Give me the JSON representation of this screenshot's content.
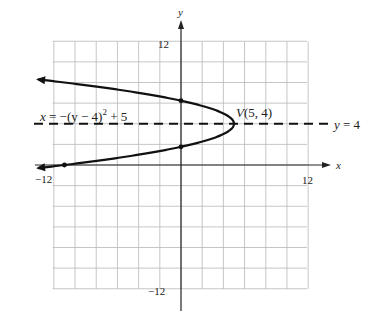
{
  "chart_data": {
    "type": "line",
    "title": "",
    "xlabel": "x",
    "ylabel": "y",
    "xlim": [
      -12,
      12
    ],
    "ylim": [
      -12,
      12
    ],
    "grid": true,
    "grid_step": 2,
    "x_tick_labels": [
      "-12",
      "12"
    ],
    "y_tick_labels": [
      "12",
      "-12"
    ],
    "series": [
      {
        "name": "x = -(y - 4)^2 + 5",
        "kind": "parabola",
        "equation": "x = -(y - 4)^2 + 5",
        "y_range": [
          -0.3,
          8.3
        ],
        "style": "solid",
        "arrows": "both-ends"
      },
      {
        "name": "y = 4",
        "kind": "axis-of-symmetry",
        "equation": "y = 4",
        "style": "dashed"
      }
    ],
    "points": [
      {
        "label": "V(5, 4)",
        "x": 5,
        "y": 4,
        "role": "vertex"
      },
      {
        "label": "",
        "x": 0,
        "y": 6.24,
        "role": "y-intercept"
      },
      {
        "label": "",
        "x": 0,
        "y": 1.76,
        "role": "y-intercept"
      },
      {
        "label": "",
        "x": -11,
        "y": 0,
        "role": "x-intercept"
      }
    ],
    "annotations": [
      {
        "text": "x = −(y − 4)",
        "sup": "2",
        "tail": " + 5",
        "position": "upper-left of vertex"
      },
      {
        "text": "V(5, 4)",
        "position": "above vertex"
      },
      {
        "text": "y =  4",
        "position": "right end of dashed line"
      }
    ]
  },
  "labels": {
    "x_axis": "x",
    "y_axis": "y",
    "x_min": "−12",
    "x_max": "12",
    "y_max": "12",
    "y_min": "−12",
    "equation_main": "x = −(y − 4)",
    "equation_sup": "2",
    "equation_tail": " + 5",
    "vertex": "V(5, 4)",
    "axis_sym_y": "y",
    "axis_sym_rest": " =  4"
  },
  "colors": {
    "grid": "#b8b8b8",
    "axis": "#222222",
    "curve": "#111111"
  }
}
